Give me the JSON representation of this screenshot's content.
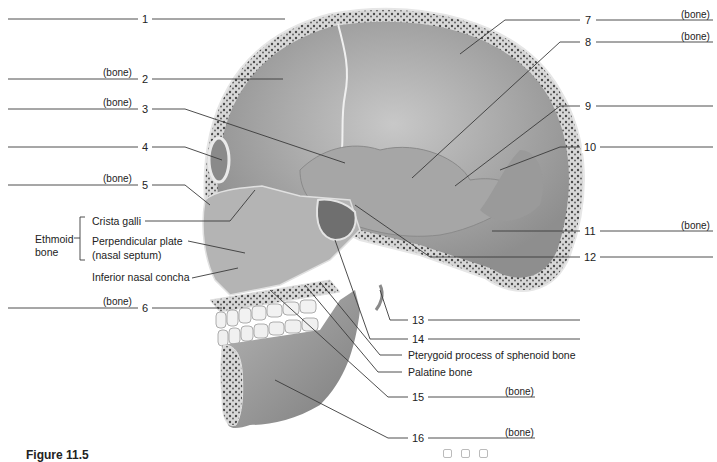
{
  "figure": {
    "caption": "Figure 11.5",
    "ethmoid_group_label_line1": "Ethmoid",
    "ethmoid_group_label_line2": "bone",
    "bone_hint": "(bone)"
  },
  "numbered_labels": [
    {
      "n": "1",
      "x": 145,
      "y": 19,
      "answer_left": true,
      "bone_hint": false
    },
    {
      "n": "2",
      "x": 145,
      "y": 79,
      "answer_left": true,
      "bone_hint": true
    },
    {
      "n": "3",
      "x": 145,
      "y": 109,
      "answer_left": true,
      "bone_hint": true
    },
    {
      "n": "4",
      "x": 145,
      "y": 147,
      "answer_left": true,
      "bone_hint": false
    },
    {
      "n": "5",
      "x": 145,
      "y": 185,
      "answer_left": true,
      "bone_hint": true
    },
    {
      "n": "6",
      "x": 145,
      "y": 308,
      "answer_left": true,
      "bone_hint": true
    },
    {
      "n": "7",
      "x": 588,
      "y": 20,
      "answer_left": false,
      "bone_hint": true
    },
    {
      "n": "8",
      "x": 588,
      "y": 42,
      "answer_left": false,
      "bone_hint": true
    },
    {
      "n": "9",
      "x": 588,
      "y": 106,
      "answer_left": false,
      "bone_hint": false
    },
    {
      "n": "10",
      "x": 589,
      "y": 147,
      "answer_left": false,
      "bone_hint": false
    },
    {
      "n": "11",
      "x": 589,
      "y": 231,
      "answer_left": false,
      "bone_hint": true
    },
    {
      "n": "12",
      "x": 589,
      "y": 257,
      "answer_left": false,
      "bone_hint": false
    },
    {
      "n": "13",
      "x": 417,
      "y": 320,
      "answer_left": false,
      "bone_hint": false
    },
    {
      "n": "14",
      "x": 417,
      "y": 339,
      "answer_left": false,
      "bone_hint": false
    },
    {
      "n": "15",
      "x": 417,
      "y": 397,
      "answer_left": false,
      "bone_hint": true
    },
    {
      "n": "16",
      "x": 417,
      "y": 438,
      "answer_left": false,
      "bone_hint": true
    }
  ],
  "text_labels": [
    {
      "name": "crista-galli",
      "text": "Crista galli",
      "x": 92,
      "y": 217
    },
    {
      "name": "perpendicular-plate",
      "text": "Perpendicular plate",
      "x": 92,
      "y": 237
    },
    {
      "name": "nasal-septum",
      "text": "(nasal septum)",
      "x": 92,
      "y": 251
    },
    {
      "name": "inferior-nasal-concha",
      "text": "Inferior nasal concha",
      "x": 92,
      "y": 273
    },
    {
      "name": "pterygoid-process",
      "text": "Pterygoid process of sphenoid bone",
      "x": 408,
      "y": 349
    },
    {
      "name": "palatine-bone",
      "text": "Palatine bone",
      "x": 408,
      "y": 366
    }
  ],
  "colors": {
    "line": "#3a3a3a",
    "skull_fill": "#9c9c9c",
    "skull_light": "#c6c6c6",
    "bone_edge": "#e4e4e4",
    "spongy": "#5a5a5a"
  }
}
